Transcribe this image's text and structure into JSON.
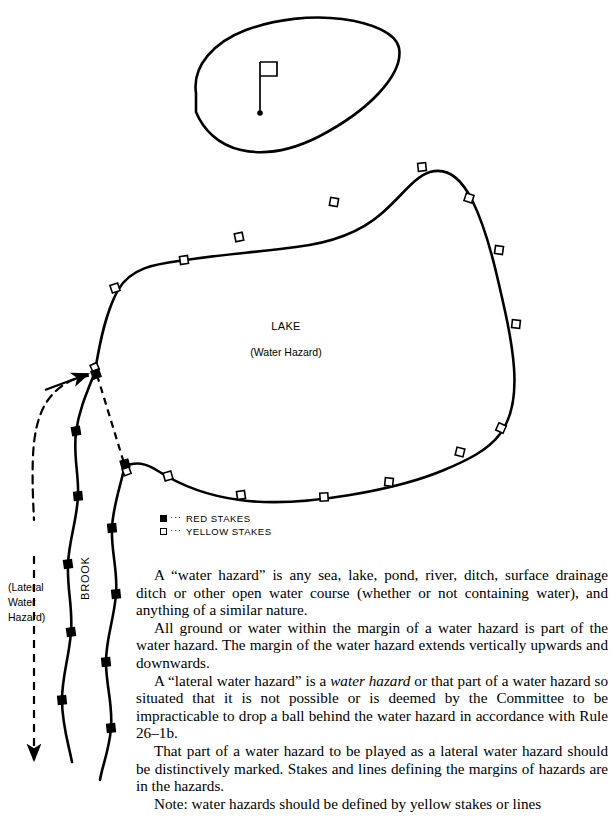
{
  "diagram": {
    "green_label": "putting-green",
    "flag": "flagstick-and-hole",
    "lake": {
      "name": "LAKE",
      "sublabel": "(Water Hazard)"
    },
    "brook": {
      "name": "BROOK",
      "lateral_label_lines": [
        "(Lateral",
        "Water",
        "Hazard)"
      ]
    },
    "legend": {
      "rows": [
        {
          "symbol": "filled-square",
          "dots": "···",
          "label": "RED STAKES"
        },
        {
          "symbol": "open-square",
          "dots": "···",
          "label": "YELLOW STAKES"
        }
      ]
    },
    "colors": {
      "ink": "#000000",
      "paper": "#ffffff"
    }
  },
  "body": {
    "paragraphs": [
      {
        "id": "p-water-hazard",
        "runs": [
          {
            "text": "A “water hazard” is any sea, lake, pond, river, ditch, surface drainage ditch or other open water course (whether or not containing water), and anything of a similar nature.",
            "style": "normal"
          }
        ]
      },
      {
        "id": "p-margin",
        "runs": [
          {
            "text": "All ground or water within the margin of a water hazard is part of the water hazard. The margin of the water hazard extends vertically upwards and downwards.",
            "style": "normal"
          }
        ]
      },
      {
        "id": "p-lateral-water-hazard",
        "runs": [
          {
            "text": "A “lateral water hazard” is a ",
            "style": "normal"
          },
          {
            "text": "water hazard",
            "style": "italic"
          },
          {
            "text": " or that part of a water hazard so situated that it is not possible or is deemed by the Committee to be impracticable to drop a ball behind the water hazard in accordance with Rule 26–1b.",
            "style": "normal"
          }
        ]
      },
      {
        "id": "p-marking",
        "runs": [
          {
            "text": "That part of a water hazard to be played as a lateral water hazard should be distinctively marked. Stakes and lines defining the margins of hazards are in the hazards.",
            "style": "normal"
          }
        ]
      },
      {
        "id": "p-note",
        "runs": [
          {
            "text": "Note: water hazards should be defined by yellow stakes or lines",
            "style": "normal"
          }
        ]
      }
    ]
  }
}
